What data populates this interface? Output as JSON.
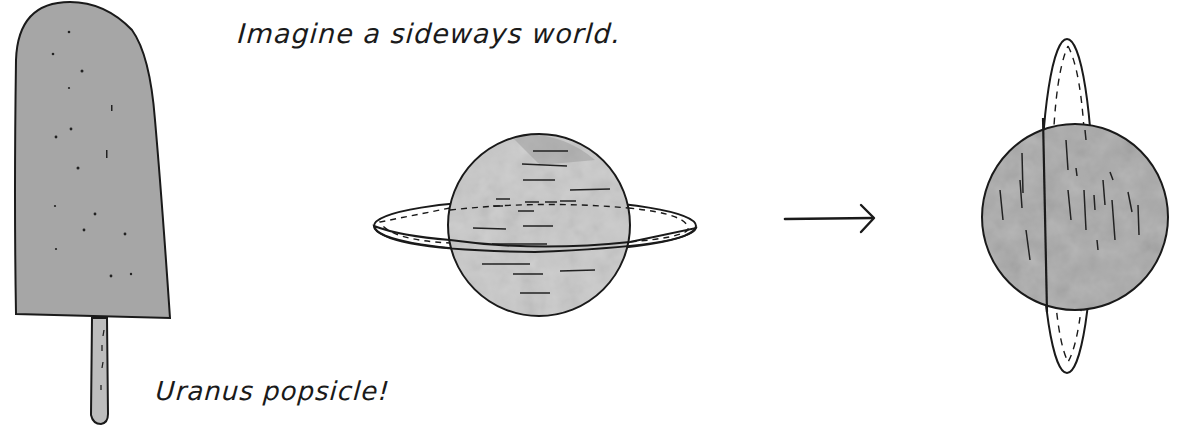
{
  "headline": "Imagine a sideways world.",
  "popsicle_caption": "Uranus popsicle!",
  "illustrations": {
    "popsicle": {
      "label": "uranus-popsicle",
      "fill": "#a6a6a6",
      "stick_fill": "#bdbdbd"
    },
    "planet_normal": {
      "label": "ringed-planet-horizontal-rings",
      "fill": "#c9c9c9"
    },
    "arrow": {
      "label": "right-arrow",
      "glyph": "→"
    },
    "planet_sideways": {
      "label": "ringed-planet-vertical-rings",
      "fill": "#a9a9a9"
    }
  },
  "colors": {
    "ink": "#1a1a1a",
    "background": "#ffffff"
  }
}
